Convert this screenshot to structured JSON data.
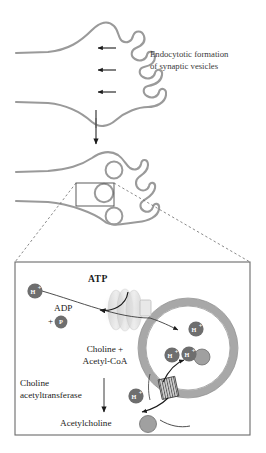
{
  "figure": {
    "title_visible": false,
    "colors": {
      "membrane": "#9a9a9a",
      "vesicle_ring": "#a8a8a8",
      "ion_circle": "#6e6e6e",
      "acetylcholine_circle": "#a0a0a0",
      "panel_border": "#6b6b6b",
      "arrow": "#1a1a1a",
      "pump_glow": "#d9d9d9",
      "text": "#1a1a1a",
      "caption_text": "#3a3a3a"
    },
    "top_panel": {
      "caption_line1": "Endocytotic formation",
      "caption_line2": "of synaptic vesicles",
      "endocytosis_arrow_count": 3
    },
    "middle_panel": {
      "vesicle_count": 3,
      "callout_box_present": true
    },
    "detail_panel": {
      "atp_label": "ATP",
      "adp_label": "ADP",
      "adp_plus": "+",
      "phosphate_label": "P",
      "substrate_line1": "Choline +",
      "substrate_line2": "Acetyl-CoA",
      "enzyme_line1": "Choline",
      "enzyme_line2": "acetyltransferase",
      "product_label": "Acetylcholine",
      "proton_label": "H",
      "proton_charge": "+",
      "proton_positions_described": [
        "outside-upper-left",
        "inside-upper-right",
        "inside-middle-left",
        "inside-middle-right",
        "outside-lower-left"
      ],
      "proton_count": 5,
      "transporter_present": true,
      "vesicular_atpase_present": true
    }
  }
}
